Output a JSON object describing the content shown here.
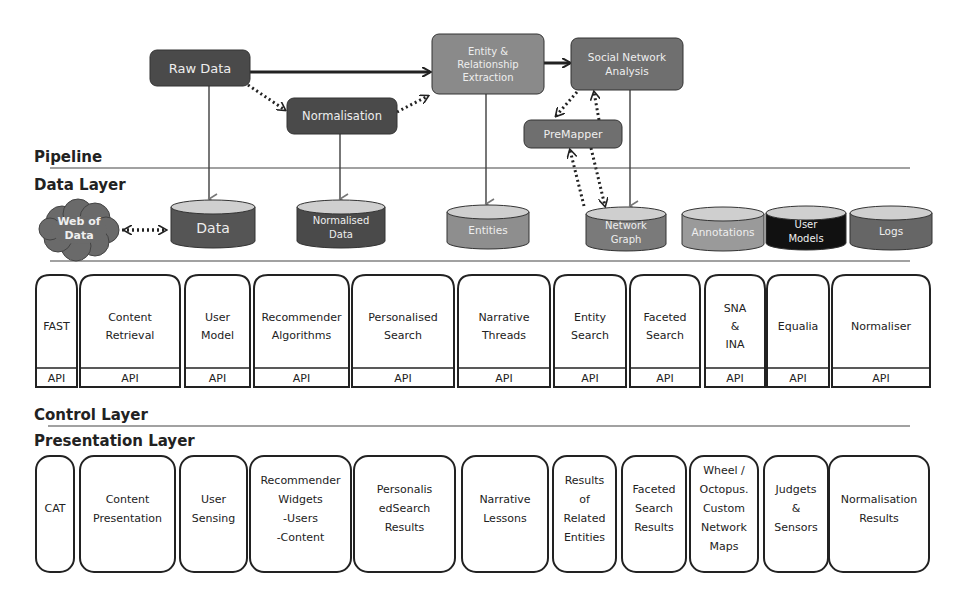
{
  "pipeline": {
    "section_label": "Pipeline",
    "nodes": [
      {
        "id": "raw-data",
        "label": [
          "Raw Data"
        ],
        "color": "#4a4a4a"
      },
      {
        "id": "normalisation",
        "label": [
          "Normalisation"
        ],
        "color": "#4a4a4a"
      },
      {
        "id": "entity-extraction",
        "label": [
          "Entity &",
          "Relationship",
          "Extraction"
        ],
        "color": "#8a8a8a"
      },
      {
        "id": "sna",
        "label": [
          "Social Network",
          "Analysis"
        ],
        "color": "#6f6f6f"
      },
      {
        "id": "premapper",
        "label": [
          "PreMapper"
        ],
        "color": "#6f6f6f"
      }
    ]
  },
  "data_layer": {
    "section_label": "Data Layer",
    "cloud": {
      "label": [
        "Web of",
        "Data"
      ],
      "color": "#6a6a6a"
    },
    "stores": [
      {
        "id": "data",
        "label": [
          "Data"
        ],
        "color": "#555555"
      },
      {
        "id": "normalised-data",
        "label": [
          "Normalised",
          "Data"
        ],
        "color": "#4a4a4a"
      },
      {
        "id": "entities",
        "label": [
          "Entities"
        ],
        "color": "#8e8e8e"
      },
      {
        "id": "network-graph",
        "label": [
          "Network",
          "Graph"
        ],
        "color": "#7a7a7a"
      },
      {
        "id": "annotations",
        "label": [
          "Annotations"
        ],
        "color": "#9a9a9a"
      },
      {
        "id": "user-models",
        "label": [
          "User",
          "Models"
        ],
        "color": "#111111"
      },
      {
        "id": "logs",
        "label": [
          "Logs"
        ],
        "color": "#666666"
      }
    ]
  },
  "api_layer": {
    "api_label": "API",
    "components": [
      {
        "label": [
          "FAST"
        ]
      },
      {
        "label": [
          "Content",
          "Retrieval"
        ]
      },
      {
        "label": [
          "User",
          "Model"
        ]
      },
      {
        "label": [
          "Recommender",
          "Algorithms"
        ]
      },
      {
        "label": [
          "Personalised",
          "Search"
        ]
      },
      {
        "label": [
          "Narrative",
          "Threads"
        ]
      },
      {
        "label": [
          "Entity",
          "Search"
        ]
      },
      {
        "label": [
          "Faceted",
          "Search"
        ]
      },
      {
        "label": [
          "SNA",
          "&",
          "INA"
        ]
      },
      {
        "label": [
          "Equalia"
        ]
      },
      {
        "label": [
          "Normaliser"
        ]
      }
    ]
  },
  "control_layer": {
    "section_label": "Control Layer"
  },
  "presentation_layer": {
    "section_label": "Presentation Layer",
    "components": [
      {
        "label": [
          "CAT"
        ]
      },
      {
        "label": [
          "Content",
          "Presentation"
        ]
      },
      {
        "label": [
          "User",
          "Sensing"
        ]
      },
      {
        "label": [
          "Recommender",
          "Widgets",
          "-Users",
          "-Content"
        ]
      },
      {
        "label": [
          "Personalis",
          "edSearch",
          "Results"
        ]
      },
      {
        "label": [
          "Narrative",
          "Lessons"
        ]
      },
      {
        "label": [
          "Results",
          "of",
          "Related",
          "Entities"
        ]
      },
      {
        "label": [
          "Faceted",
          "Search",
          "Results"
        ]
      },
      {
        "label": [
          "Wheel /",
          "Octopus.",
          "Custom",
          "Network",
          "Maps"
        ]
      },
      {
        "label": [
          "Judgets",
          "&",
          "Sensors"
        ]
      },
      {
        "label": [
          "Normalisation",
          "Results"
        ]
      }
    ]
  }
}
